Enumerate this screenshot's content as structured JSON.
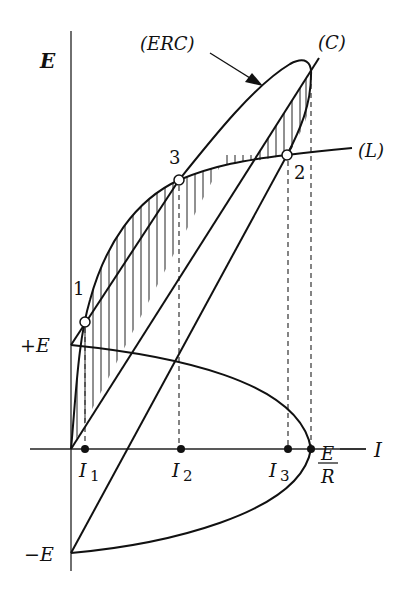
{
  "figure": {
    "type": "characteristic-curve-diagram",
    "axes": {
      "y_label": "E",
      "x_label": "I",
      "y_ticks": [
        "+E",
        "−E"
      ],
      "x_ticks": [
        "I",
        "1",
        "I",
        "2",
        "I",
        "3",
        "E",
        "R"
      ]
    },
    "labels": {
      "erc": "(ERC)",
      "c": "(C)",
      "l": "(L)",
      "point1": "1",
      "point2": "2",
      "point3": "3",
      "y_axis": "E",
      "x_axis": "I",
      "plus_e": "+E",
      "minus_e": "−E",
      "i_sym": "I",
      "i1_sub": "1",
      "i2_sub": "2",
      "i3_sub": "3",
      "er_num": "E",
      "er_den": "R"
    },
    "points": [
      {
        "name": "1",
        "x": 85,
        "y": 322,
        "marker": "open-circle"
      },
      {
        "name": "3",
        "x": 179,
        "y": 180,
        "marker": "open-circle"
      },
      {
        "name": "2",
        "x": 287,
        "y": 155,
        "marker": "open-circle"
      }
    ],
    "x_axis_marks": [
      {
        "name": "I1",
        "x": 85
      },
      {
        "name": "I2",
        "x": 179
      },
      {
        "name": "I3",
        "x": 288
      },
      {
        "name": "E/R",
        "x": 311
      }
    ],
    "colors": {
      "ink": "#111111",
      "background": "#ffffff"
    }
  }
}
